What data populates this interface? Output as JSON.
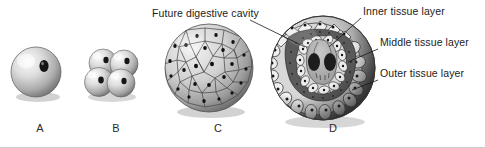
{
  "figure": {
    "background_color": "#ffffff",
    "ink_color": "#1b1b1b"
  },
  "callouts": [
    {
      "id": "future-digestive-cavity",
      "text": "Future digestive cavity",
      "label_x": 152,
      "label_y": 7,
      "leader": "M250,20 L305,47"
    },
    {
      "id": "inner-tissue-layer",
      "text": "Inner tissue layer",
      "label_x": 363,
      "label_y": 5,
      "leader": "M361,18 L329,47"
    },
    {
      "id": "middle-tissue-layer",
      "text": "Middle tissue layer",
      "label_x": 380,
      "label_y": 36,
      "leader": "M378,49 L348,62"
    },
    {
      "id": "outer-tissue-layer",
      "text": "Outer tissue layer",
      "label_x": 380,
      "label_y": 67,
      "leader": "M378,80 L352,90"
    }
  ],
  "stages": [
    {
      "id": "stage-a",
      "letter": "A",
      "name": "zygote",
      "letter_x": 30,
      "letter_y": 122,
      "center_x": 36,
      "center_y": 72,
      "radius": 25
    },
    {
      "id": "stage-b",
      "letter": "B",
      "name": "four-cell-stage",
      "letter_x": 106,
      "letter_y": 122,
      "center_x": 110,
      "center_y": 72,
      "radius": 27
    },
    {
      "id": "stage-c",
      "letter": "C",
      "name": "blastula",
      "letter_x": 208,
      "letter_y": 122,
      "center_x": 209,
      "center_y": 68,
      "radius": 44
    },
    {
      "id": "stage-d",
      "letter": "D",
      "name": "gastrula",
      "letter_x": 323,
      "letter_y": 122,
      "center_x": 323,
      "center_y": 68,
      "radius": 52
    }
  ],
  "colors": {
    "cell_light": "#efefef",
    "cell_mid": "#b9b9b9",
    "cell_dark": "#6e6e6e",
    "nucleus": "#141414",
    "outline": "#2b2b2b",
    "shadow": "#3a3a3a"
  }
}
